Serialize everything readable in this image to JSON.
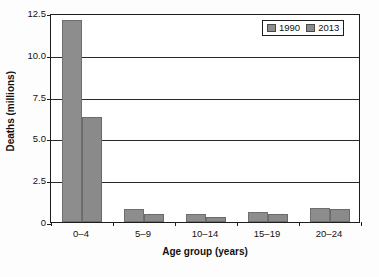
{
  "chart_data": {
    "type": "bar",
    "title": "",
    "xlabel": "Age group (years)",
    "ylabel": "Deaths (millions)",
    "categories": [
      "0–4",
      "5–9",
      "10–14",
      "15–19",
      "20–24"
    ],
    "series": [
      {
        "name": "1990",
        "values": [
          12.1,
          0.8,
          0.45,
          0.62,
          0.85
        ],
        "color": "#8d8d8d"
      },
      {
        "name": "2013",
        "values": [
          6.3,
          0.45,
          0.28,
          0.48,
          0.75
        ],
        "color": "#8a8a8a"
      }
    ],
    "ylim": [
      0,
      12.5
    ],
    "yticks": [
      0,
      2.5,
      5.0,
      7.5,
      10.0,
      12.5
    ],
    "ytick_labels": [
      "0",
      "2.5",
      "5.0",
      "7.5",
      "10.0",
      "12.5"
    ],
    "grid": true,
    "grid_axis": "y",
    "legend_position": "top-right",
    "legend_entries": [
      "1990",
      "2013"
    ]
  }
}
